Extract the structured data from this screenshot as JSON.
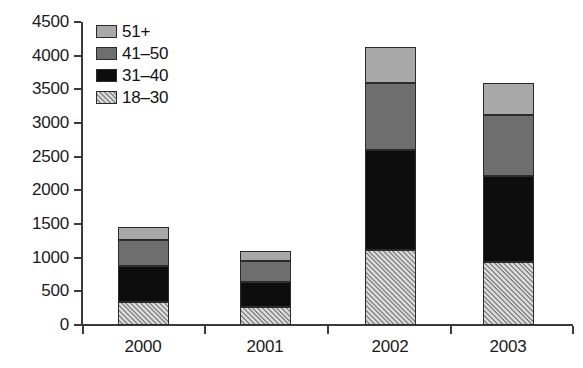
{
  "chart_data": {
    "type": "bar",
    "subtype": "stacked-bar",
    "title": "",
    "subtitle": "",
    "xlabel": "",
    "ylabel": "",
    "categories": [
      "2000",
      "2001",
      "2002",
      "2003"
    ],
    "series": [
      {
        "name": "18–30",
        "fill": "hatch",
        "color": "#d9d9d9",
        "values": [
          340,
          270,
          1120,
          940
        ]
      },
      {
        "name": "31–40",
        "fill": "dark",
        "color": "#0d0d0d",
        "values": [
          540,
          370,
          1480,
          1280
        ]
      },
      {
        "name": "41–50",
        "fill": "medium",
        "color": "#6e6e6e",
        "values": [
          380,
          310,
          1000,
          900
        ]
      },
      {
        "name": "51+",
        "fill": "light",
        "color": "#a8a8a8",
        "values": [
          190,
          150,
          530,
          470
        ]
      }
    ],
    "totals": [
      1450,
      1100,
      4130,
      3590
    ],
    "cumulative_tops": {
      "2000": {
        "18-30": 340,
        "31-40": 880,
        "41-50": 1260,
        "51+": 1450
      },
      "2001": {
        "18-30": 270,
        "31-40": 640,
        "41-50": 950,
        "51+": 1100
      },
      "2002": {
        "18-30": 1120,
        "31-40": 2600,
        "41-50": 3600,
        "51+": 4130
      },
      "2003": {
        "18-30": 940,
        "31-40": 2220,
        "41-50": 3120,
        "51+": 3590
      }
    },
    "ylim": [
      0,
      4500
    ],
    "ytick_step": 500,
    "ytick_labels": [
      "0",
      "500",
      "1000",
      "1500",
      "2000",
      "2500",
      "3000",
      "3500",
      "4000",
      "4500"
    ],
    "grid": false,
    "legend_position": "top-left",
    "legend_entries": [
      "51+",
      "41–50",
      "31–40",
      "18–30"
    ]
  },
  "legend": {
    "items": [
      {
        "label": "51+",
        "swatch": "light-gray-swatch"
      },
      {
        "label": "41–50",
        "swatch": "medium-gray-swatch"
      },
      {
        "label": "31–40",
        "swatch": "black-swatch"
      },
      {
        "label": "18–30",
        "swatch": "hatched-swatch"
      }
    ]
  },
  "axes": {
    "y_ticks": [
      "4500",
      "4000",
      "3500",
      "3000",
      "2500",
      "2000",
      "1500",
      "1000",
      "500",
      "0"
    ],
    "x_ticks": [
      "2000",
      "2001",
      "2002",
      "2003"
    ]
  }
}
